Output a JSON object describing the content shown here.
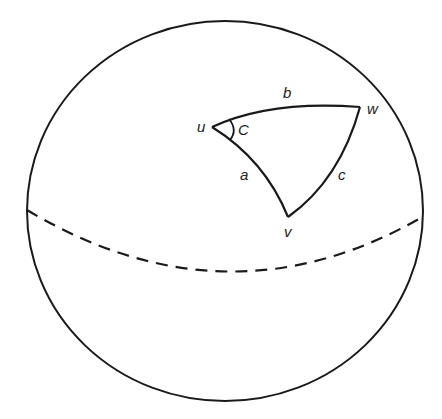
{
  "diagram": {
    "type": "spherical-triangle",
    "colors": {
      "stroke": "#1a1a1a",
      "label": "#222222",
      "background": "#ffffff"
    },
    "sphere": {
      "cx": 225,
      "cy": 211,
      "rx": 198,
      "ry": 190
    },
    "equator": {
      "style": "dashed",
      "start": [
        27,
        210
      ],
      "lowest": [
        228,
        269
      ],
      "end": [
        424,
        216
      ]
    },
    "vertices": {
      "u": {
        "label": "u",
        "x": 212,
        "y": 127
      },
      "w": {
        "label": "w",
        "x": 360,
        "y": 107
      },
      "v": {
        "label": "v",
        "x": 288,
        "y": 217
      }
    },
    "sides": {
      "a": {
        "label": "a",
        "from": "u",
        "to": "v"
      },
      "b": {
        "label": "b",
        "from": "u",
        "to": "w"
      },
      "c": {
        "label": "c",
        "from": "w",
        "to": "v"
      }
    },
    "angle": {
      "label": "C",
      "at": "u"
    }
  }
}
